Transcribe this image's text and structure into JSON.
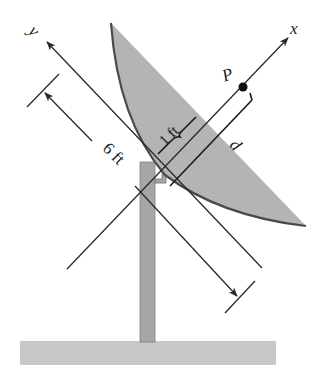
{
  "diagram": {
    "type": "engineering-mechanics figure",
    "labels": {
      "x_axis": "x",
      "y_axis": "y",
      "point": "P",
      "distance_d": "d",
      "dim_one": "1 ft",
      "dim_six": "6 ft"
    },
    "colors": {
      "dish_fill": "#b4b4b4",
      "dish_rim": "#555555",
      "post_fill": "#a6a6a6",
      "post_stroke": "#777777",
      "ground_fill": "#c8c8c8",
      "line": "#2a2a2a",
      "background": "#ffffff"
    }
  }
}
